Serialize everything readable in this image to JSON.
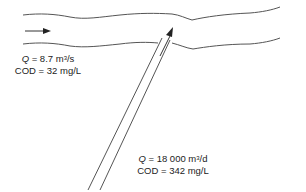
{
  "diagram": {
    "type": "river-outfall-mixing",
    "colors": {
      "line": "#555555",
      "text": "#222222",
      "background": "#ffffff"
    },
    "river": {
      "flow_direction": "left-to-right",
      "label": {
        "q_symbol": "Q",
        "q_rest_prefix": " = 8.7 m",
        "q_sup": "3",
        "q_rest_suffix": "/s",
        "cod": "COD = 32 mg/L"
      }
    },
    "outfall": {
      "flow_direction": "into-river",
      "label": {
        "q_symbol": "Q",
        "q_rest_prefix": " = 18 000 m",
        "q_sup": "3",
        "q_rest_suffix": "/d",
        "cod": "COD = 342 mg/L"
      }
    }
  }
}
